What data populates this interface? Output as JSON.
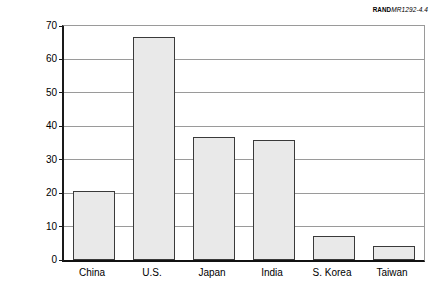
{
  "credit": {
    "organization": "RAND",
    "document_number": "MR1292-4.4"
  },
  "chart_data": {
    "type": "bar",
    "title": "",
    "xlabel": "",
    "ylabel": "Number of degrees (in thousands)",
    "categories": [
      "China",
      "U.S.",
      "Japan",
      "India",
      "S. Korea",
      "Taiwan"
    ],
    "values": [
      20.5,
      66.7,
      36.7,
      35.8,
      7.3,
      4.2
    ],
    "ylim": [
      0,
      70
    ],
    "yticks": [
      0,
      10,
      20,
      30,
      40,
      50,
      60,
      70
    ],
    "ytick_labels": [
      "0",
      "10",
      "20",
      "30",
      "40",
      "50",
      "60",
      "70"
    ],
    "grid": true,
    "legend": "none",
    "bar_fill_color": "#e9e9e9",
    "bar_edge_color": "#3a3a3a",
    "axis_color": "#111111",
    "gridline_color": "#9a9a9a"
  }
}
